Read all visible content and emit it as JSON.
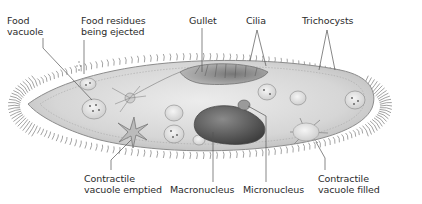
{
  "diagram": {
    "labels": {
      "food_vacuole": "Food\nvacuole",
      "food_residues": "Food residues\nbeing ejected",
      "gullet": "Gullet",
      "cilia": "Cilia",
      "trichocysts": "Trichocysts",
      "contractile_vacuole_emptied": "Contractile\nvacuole emptied",
      "macronucleus": "Macronucleus",
      "micronucleus": "Micronucleus",
      "contractile_vacuole_filled": "Contractile\nvacuole filled"
    },
    "colors": {
      "background": "#ffffff",
      "body_fill": "#d9d9d9",
      "body_edge": "#8c8c8c",
      "cilia": "#6e6e6e",
      "macronucleus": "#5a5a5a",
      "leader_line": "#555555",
      "label_text": "#2b2b2b"
    }
  }
}
